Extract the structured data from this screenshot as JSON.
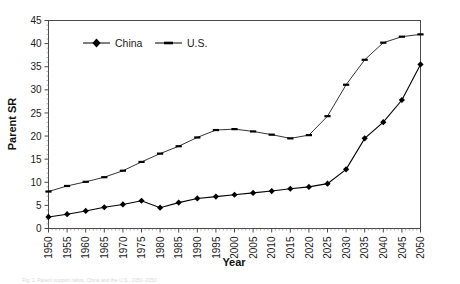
{
  "chart_data": {
    "type": "line",
    "title": "",
    "xlabel": "Year",
    "ylabel": "Parent SR",
    "xlim": [
      1950,
      2050
    ],
    "ylim": [
      0,
      45
    ],
    "ytick_step": 5,
    "xtick_step": 5,
    "grid": false,
    "legend_position": "top-left-inside",
    "categories": [
      1950,
      1955,
      1960,
      1965,
      1970,
      1975,
      1980,
      1985,
      1990,
      1995,
      2000,
      2005,
      2010,
      2015,
      2020,
      2025,
      2030,
      2035,
      2040,
      2045,
      2050
    ],
    "xticklabels": [
      "1950",
      "1955",
      "1960",
      "1965",
      "1970",
      "1975",
      "1980",
      "1985",
      "1990",
      "1995",
      "2000",
      "2005",
      "2010",
      "2015",
      "2020",
      "2025",
      "2030",
      "2035",
      "2040",
      "2045",
      "2050"
    ],
    "yticklabels": [
      "0",
      "5",
      "10",
      "15",
      "20",
      "25",
      "30",
      "35",
      "40",
      "45"
    ],
    "series": [
      {
        "name": "China",
        "marker": "filled-diamond",
        "color": "#000000",
        "values": [
          2.5,
          3.1,
          3.8,
          4.6,
          5.2,
          6.0,
          4.5,
          5.6,
          6.5,
          6.9,
          7.3,
          7.7,
          8.1,
          8.6,
          9.0,
          9.7,
          12.8,
          19.5,
          23.0,
          27.8,
          35.5
        ]
      },
      {
        "name": "U.S.",
        "marker": "dash",
        "color": "#000000",
        "values": [
          8.0,
          9.2,
          10.1,
          11.1,
          12.5,
          14.4,
          16.2,
          17.8,
          19.7,
          21.3,
          21.5,
          21.0,
          20.3,
          19.5,
          20.2,
          24.3,
          31.1,
          36.5,
          40.2,
          41.5,
          42.0
        ]
      }
    ],
    "annotations": []
  },
  "legend": {
    "items": [
      {
        "label": "China"
      },
      {
        "label": "U.S."
      }
    ]
  },
  "caption": {
    "text": "Fig. 1. Parent support ratios, China and the U.S., 1950–2050."
  }
}
